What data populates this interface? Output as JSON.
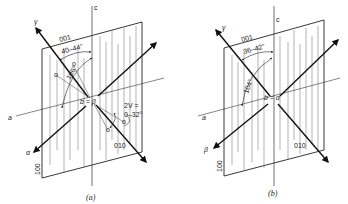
{
  "panels": [
    {
      "id": "a",
      "caption": "(a)",
      "labels": {
        "gamma": "γ",
        "c_axis": "c",
        "face_001": "001",
        "angle_top": "40–44°",
        "angle_mid": "106°",
        "center": "b = β",
        "a_axis": "a",
        "alpha": "α",
        "face_010": "010",
        "face_100": "100",
        "twoV_line1": "2V =",
        "twoV_line2": "0–32°",
        "o1": "o",
        "o2": "o",
        "o3": "o",
        "o4": "o"
      }
    },
    {
      "id": "b",
      "caption": "(b)",
      "labels": {
        "gamma": "γ",
        "c_axis": "c",
        "face_001": "001",
        "angle_top": "36–42°",
        "angle_mid": "104°",
        "center": "b = α",
        "a_axis": "a",
        "beta": "β",
        "face_010": "010",
        "face_100": "100"
      }
    }
  ]
}
